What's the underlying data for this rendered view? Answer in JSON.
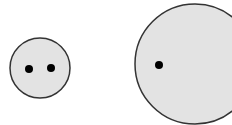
{
  "diagram": {
    "background": "#ffffff",
    "fill_color": "#e3e3e3",
    "stroke_color": "#333333",
    "dot_color": "#000000",
    "small_circle": {
      "cx": 40,
      "cy": 68,
      "r": 30,
      "dots": [
        {
          "cx": 29,
          "cy": 69,
          "r": 4
        },
        {
          "cx": 51,
          "cy": 68,
          "r": 4
        }
      ]
    },
    "large_circle": {
      "cx": 195,
      "cy": 64,
      "r": 60,
      "dots": [
        {
          "cx": 159,
          "cy": 65,
          "r": 4
        }
      ]
    }
  }
}
